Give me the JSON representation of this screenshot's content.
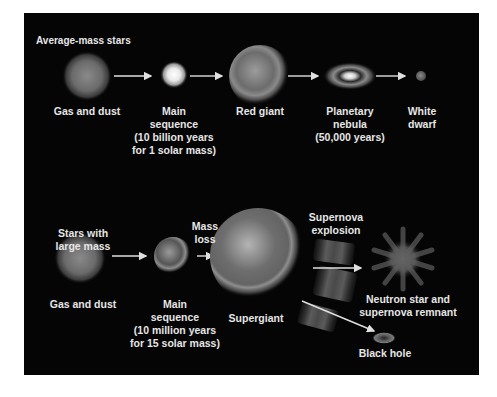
{
  "diagram": {
    "type": "stellar-evolution",
    "background_color": "#050505",
    "text_color": "#e6e6e6",
    "rows": [
      {
        "title": "Average-mass stars",
        "stages": [
          {
            "id": "gas-dust",
            "label": [
              "Gas and dust"
            ]
          },
          {
            "id": "main-sequence",
            "label": [
              "Main",
              "sequence",
              "(10 billion years",
              "for 1 solar mass)"
            ]
          },
          {
            "id": "red-giant",
            "label": [
              "Red giant"
            ]
          },
          {
            "id": "planetary-nebula",
            "label": [
              "Planetary",
              "nebula",
              "(50,000 years)"
            ]
          },
          {
            "id": "white-dwarf",
            "label": [
              "White",
              "dwarf"
            ]
          }
        ]
      },
      {
        "title_lines": [
          "Stars with",
          "large mass"
        ],
        "stages": [
          {
            "id": "gas-dust",
            "label": [
              "Gas and dust"
            ]
          },
          {
            "id": "main-sequence",
            "label": [
              "Main",
              "sequence",
              "(10 million years",
              "for 15 solar mass)"
            ]
          },
          {
            "id": "mass-loss",
            "label": [
              "Mass",
              "loss"
            ]
          },
          {
            "id": "supergiant",
            "label": [
              "Supergiant"
            ]
          },
          {
            "id": "supernova",
            "label": [
              "Supernova",
              "explosion"
            ]
          },
          {
            "id": "neutron-star",
            "label": [
              "Neutron star and",
              "supernova remnant"
            ]
          },
          {
            "id": "black-hole",
            "label": [
              "Black hole"
            ]
          }
        ]
      }
    ]
  }
}
